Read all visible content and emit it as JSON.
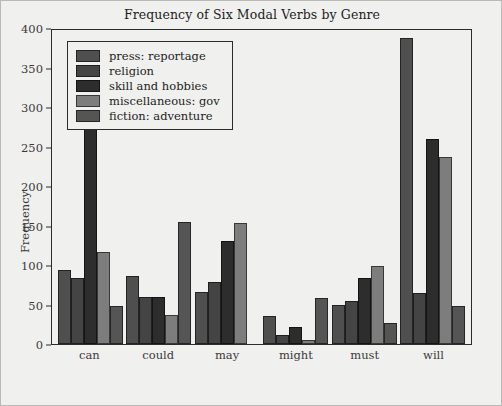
{
  "chart_data": {
    "type": "bar",
    "title": "Frequency of Six Modal Verbs by Genre",
    "xlabel": "",
    "ylabel": "Frequency",
    "categories": [
      "can",
      "could",
      "may",
      "might",
      "must",
      "will"
    ],
    "ylim": [
      0,
      400
    ],
    "yticks": [
      0,
      50,
      100,
      150,
      200,
      250,
      300,
      350,
      400
    ],
    "grid": false,
    "legend_position": "upper left",
    "series": [
      {
        "name": "press: reportage",
        "color": "#4f4f4f",
        "values": [
          94,
          86,
          66,
          36,
          50,
          387
        ]
      },
      {
        "name": "religion",
        "color": "#444444",
        "values": [
          84,
          59,
          79,
          12,
          54,
          64
        ]
      },
      {
        "name": "skill and hobbies",
        "color": "#2d2d2d",
        "values": [
          273,
          59,
          131,
          22,
          83,
          259
        ]
      },
      {
        "name": "miscellaneous: gov",
        "color": "#7d7d7d",
        "values": [
          116,
          37,
          153,
          5,
          99,
          237
        ]
      },
      {
        "name": "fiction: adventure",
        "color": "#555555",
        "values": [
          48,
          154,
          0,
          58,
          27,
          48
        ]
      }
    ]
  }
}
